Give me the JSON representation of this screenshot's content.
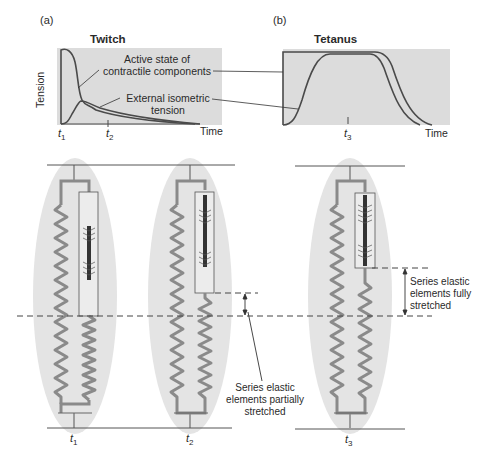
{
  "panels": {
    "a": {
      "label": "(a)",
      "title": "Twitch",
      "ylabel": "Tension",
      "xlabel": "Time",
      "time_marks": [
        {
          "base": "t",
          "sub": "1"
        },
        {
          "base": "t",
          "sub": "2"
        }
      ]
    },
    "b": {
      "label": "(b)",
      "title": "Tetanus",
      "xlabel": "Time",
      "time_marks": [
        {
          "base": "t",
          "sub": "3"
        }
      ]
    }
  },
  "annotations": {
    "active_state_line1": "Active state of",
    "active_state_line2": "contractile components",
    "external_line1": "External isometric",
    "external_line2": "tension",
    "partial_line1": "Series elastic",
    "partial_line2": "elements partially",
    "partial_line3": "stretched",
    "full_line1": "Series elastic",
    "full_line2": "elements fully",
    "full_line3": "stretched"
  },
  "muscle_models": [
    {
      "time_label": {
        "base": "t",
        "sub": "1"
      },
      "state": "rest"
    },
    {
      "time_label": {
        "base": "t",
        "sub": "2"
      },
      "state": "partially stretched"
    },
    {
      "time_label": {
        "base": "t",
        "sub": "3"
      },
      "state": "fully stretched"
    }
  ],
  "colors": {
    "graph_bg": "#dcdcdc",
    "ellipse_bg": "#e4e4e4",
    "curve": "#4a4a4a",
    "spring": "#8a8a8a",
    "filament": "#333333"
  }
}
